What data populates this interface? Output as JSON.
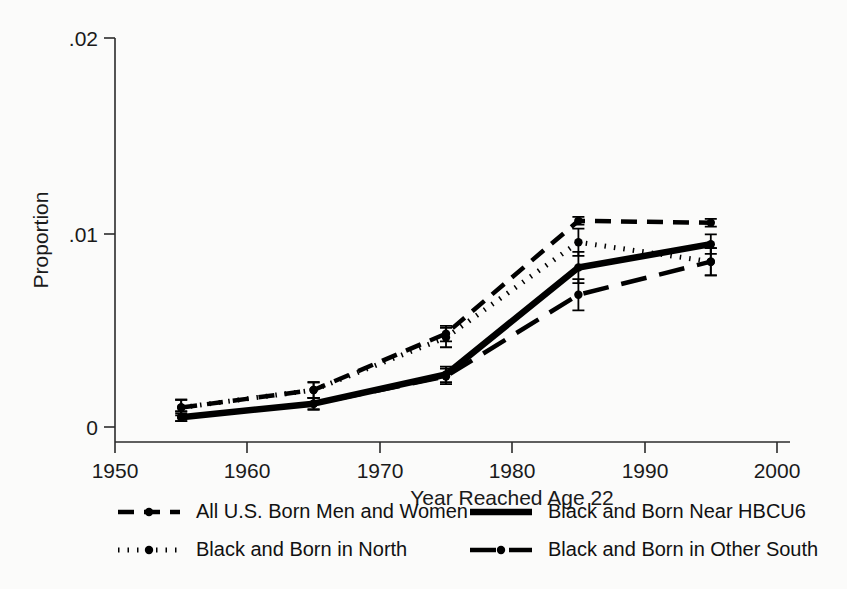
{
  "chart_data": {
    "type": "line",
    "title": "",
    "xlabel": "Year Reached Age 22",
    "ylabel": "Proportion",
    "xlim": [
      1950,
      2000
    ],
    "ylim": [
      0,
      0.02
    ],
    "xticks": [
      1950,
      1960,
      1970,
      1980,
      1990,
      2000
    ],
    "xtick_labels": [
      "1950",
      "1960",
      "1970",
      "1980",
      "1990",
      "2000"
    ],
    "yticks": [
      0,
      0.01,
      0.02
    ],
    "ytick_labels": [
      "0",
      ".01",
      ".02"
    ],
    "grid": false,
    "legend_position": "below",
    "x": [
      1955,
      1965,
      1975,
      1985,
      1995
    ],
    "series": [
      {
        "name": "All U.S. Born Men and Women",
        "style": "dashed",
        "values": [
          0.001,
          0.0019,
          0.0048,
          0.0106,
          0.0105
        ],
        "err_low": [
          0.0007,
          0.0015,
          0.0044,
          0.0104,
          0.0103
        ],
        "err_high": [
          0.0014,
          0.0023,
          0.0052,
          0.0108,
          0.0107
        ]
      },
      {
        "name": "Black and Born Near HBCU6",
        "style": "solid",
        "values": [
          0.0005,
          0.0012,
          0.0027,
          0.0082,
          0.0094
        ],
        "err_low": [
          0.0003,
          0.0009,
          0.0023,
          0.0074,
          0.0089
        ],
        "err_high": [
          0.0008,
          0.0015,
          0.0031,
          0.009,
          0.0099
        ]
      },
      {
        "name": "Black and Born in North",
        "style": "dotted",
        "values": [
          0.001,
          0.0019,
          0.0046,
          0.0095,
          0.0085
        ],
        "err_low": [
          0.0006,
          0.0015,
          0.0041,
          0.0088,
          0.0078
        ],
        "err_high": [
          0.0014,
          0.0023,
          0.0051,
          0.0102,
          0.0092
        ]
      },
      {
        "name": "Black and Born in Other South",
        "style": "long-dash",
        "values": [
          0.0005,
          0.0012,
          0.0026,
          0.0068,
          0.0085
        ],
        "err_low": [
          0.0003,
          0.0009,
          0.0022,
          0.006,
          0.0078
        ],
        "err_high": [
          0.0008,
          0.0015,
          0.003,
          0.0076,
          0.0092
        ]
      }
    ]
  },
  "axes": {
    "y_title": "Proportion",
    "x_title": "Year Reached Age 22"
  },
  "legend": {
    "entries": [
      {
        "label": "All U.S. Born Men and Women",
        "style": "dashed"
      },
      {
        "label": "Black and Born Near HBCU6",
        "style": "solid"
      },
      {
        "label": "Black and Born in North",
        "style": "dotted"
      },
      {
        "label": "Black and Born in Other South",
        "style": "long-dash"
      }
    ]
  }
}
